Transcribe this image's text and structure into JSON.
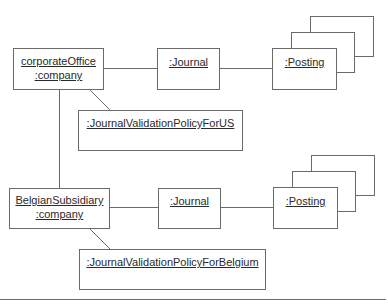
{
  "diagram": {
    "type": "uml-object-diagram",
    "objects": {
      "corporate_office": {
        "line1": "corporateOffice",
        "line2": ":company"
      },
      "journal_us": {
        "label": ":Journal"
      },
      "posting_us": {
        "label": ":Posting"
      },
      "policy_us": {
        "label": ":JournalValidationPolicyForUS"
      },
      "belgian_subsidiary": {
        "line1": "BelgianSubsidiary",
        "line2": ":company"
      },
      "journal_be": {
        "label": ":Journal"
      },
      "posting_be": {
        "label": ":Posting"
      },
      "policy_be": {
        "label": ":JournalValidationPolicyForBelgium"
      }
    },
    "links": [
      {
        "from": "corporateOffice:company",
        "to": ":Journal"
      },
      {
        "from": ":Journal",
        "to": ":Posting (multi)"
      },
      {
        "from": "corporateOffice:company",
        "to": ":JournalValidationPolicyForUS"
      },
      {
        "from": "corporateOffice:company",
        "to": "BelgianSubsidiary:company"
      },
      {
        "from": "BelgianSubsidiary:company",
        "to": ":Journal"
      },
      {
        "from": ":Journal",
        "to": ":Posting (multi)"
      },
      {
        "from": "BelgianSubsidiary:company",
        "to": ":JournalValidationPolicyForBelgium"
      }
    ],
    "colors": {
      "stroke": "#6a6a6a",
      "text": "#2a2a2a",
      "background": "#ffffff"
    }
  }
}
